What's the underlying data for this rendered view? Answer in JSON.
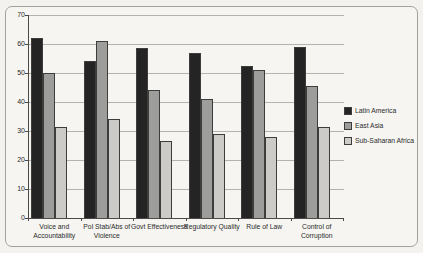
{
  "chart_data": {
    "type": "bar",
    "title": "",
    "xlabel": "",
    "ylabel": "",
    "categories": [
      "Voice and\nAccountability",
      "Pol Stab/Abs of\nViolence",
      "Govt Effectiveness",
      "Regulatory Quality",
      "Rule of Law",
      "Control of\nCorruption"
    ],
    "series": [
      {
        "name": "Latin America",
        "color": "#242424",
        "values": [
          62,
          54,
          58.5,
          57,
          52.5,
          59
        ]
      },
      {
        "name": "East Asia",
        "color": "#9d9d9b",
        "values": [
          50,
          61,
          44,
          41,
          51,
          45.5
        ]
      },
      {
        "name": "Sub-Saharan Africa",
        "color": "#cccbc7",
        "values": [
          31.5,
          34,
          26.5,
          29,
          28,
          31.5
        ]
      }
    ],
    "ylim": [
      0,
      70
    ],
    "yticks": [
      0,
      10,
      20,
      30,
      40,
      50,
      60,
      70
    ],
    "grid": true,
    "legend_position": "right"
  },
  "style": {
    "gridline_color": "#b4b2ae",
    "axis_color": "#4a4a48",
    "bar_border_color": "#3d3d3b",
    "background": "#f4f2ee",
    "frame_border_color": "#a3a19c"
  }
}
